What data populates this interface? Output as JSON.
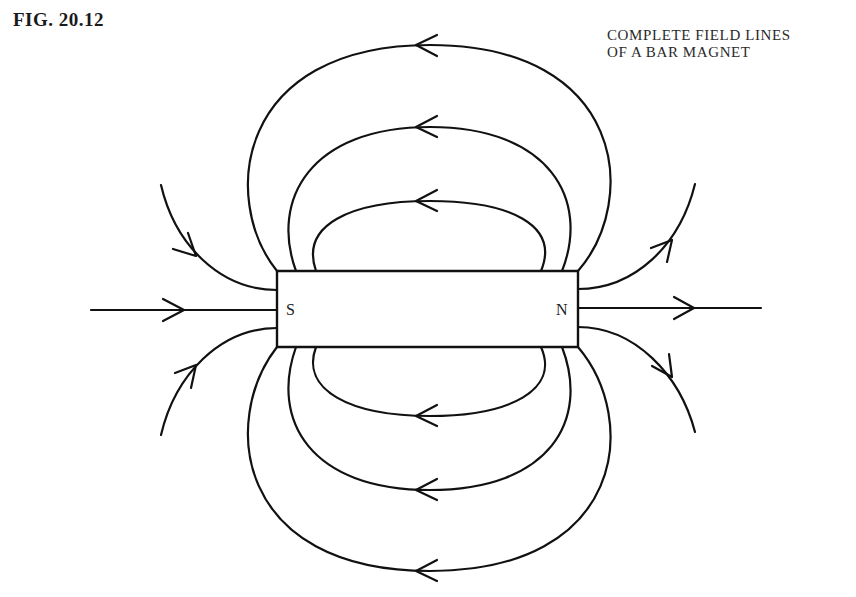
{
  "figure": {
    "label": "FIG. 20.12",
    "caption_lines": [
      "COMPLETE FIELD LINES",
      "OF A BAR MAGNET"
    ]
  },
  "magnet": {
    "south_label": "S",
    "north_label": "N"
  },
  "colors": {
    "line": "#111111",
    "background": "#ffffff"
  }
}
